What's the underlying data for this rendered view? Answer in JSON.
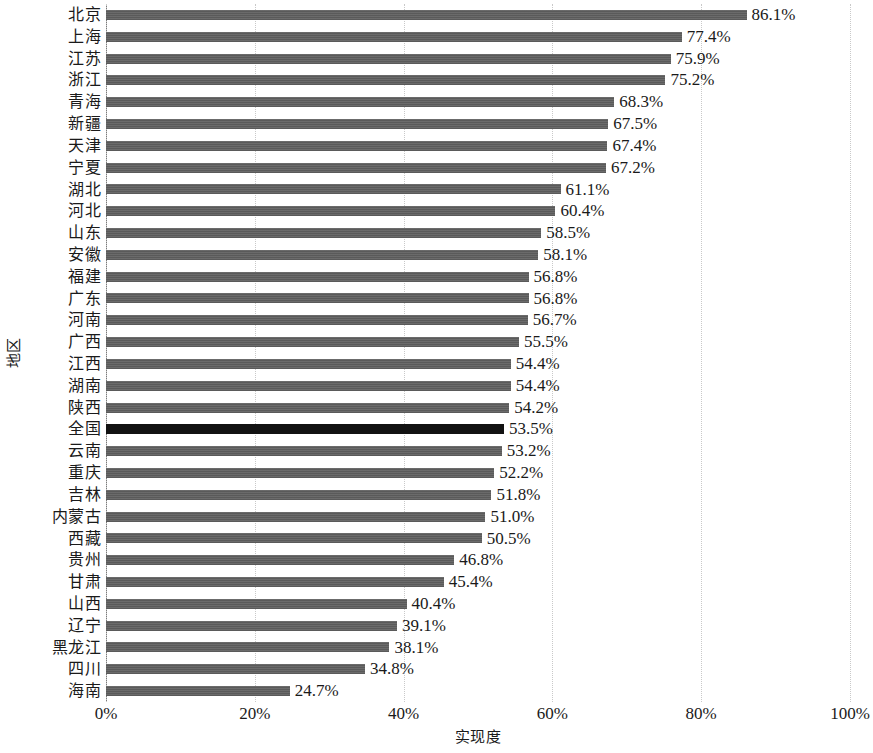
{
  "chart_data": {
    "type": "bar",
    "orientation": "horizontal",
    "title": "",
    "xlabel": "实现度",
    "ylabel": "地区",
    "xlim": [
      0,
      100
    ],
    "xticks": [
      "0%",
      "20%",
      "40%",
      "60%",
      "80%",
      "100%"
    ],
    "xtick_values": [
      0,
      20,
      40,
      60,
      80,
      100
    ],
    "grid": "vertical-dotted",
    "legend": "none",
    "value_suffix": "%",
    "bar_color": "#5a5a5a",
    "highlight_color": "#121212",
    "highlight_category": "全国",
    "categories": [
      "北京",
      "上海",
      "江苏",
      "浙江",
      "青海",
      "新疆",
      "天津",
      "宁夏",
      "湖北",
      "河北",
      "山东",
      "安徽",
      "福建",
      "广东",
      "河南",
      "广西",
      "江西",
      "湖南",
      "陕西",
      "全国",
      "云南",
      "重庆",
      "吉林",
      "内蒙古",
      "西藏",
      "贵州",
      "甘肃",
      "山西",
      "辽宁",
      "黑龙江",
      "四川",
      "海南"
    ],
    "values": [
      86.1,
      77.4,
      75.9,
      75.2,
      68.3,
      67.5,
      67.4,
      67.2,
      61.1,
      60.4,
      58.5,
      58.1,
      56.8,
      56.8,
      56.7,
      55.5,
      54.4,
      54.4,
      54.2,
      53.5,
      53.2,
      52.2,
      51.8,
      51.0,
      50.5,
      46.8,
      45.4,
      40.4,
      39.1,
      38.1,
      34.8,
      24.7
    ],
    "value_labels": [
      "86.1%",
      "77.4%",
      "75.9%",
      "75.2%",
      "68.3%",
      "67.5%",
      "67.4%",
      "67.2%",
      "61.1%",
      "60.4%",
      "58.5%",
      "58.1%",
      "56.8%",
      "56.8%",
      "56.7%",
      "55.5%",
      "54.4%",
      "54.4%",
      "54.2%",
      "53.5%",
      "53.2%",
      "52.2%",
      "51.8%",
      "51.0%",
      "50.5%",
      "46.8%",
      "45.4%",
      "40.4%",
      "39.1%",
      "38.1%",
      "34.8%",
      "24.7%"
    ]
  }
}
